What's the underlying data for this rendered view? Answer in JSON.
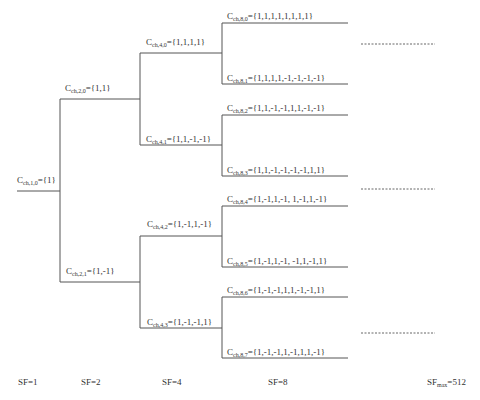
{
  "diagram": {
    "type": "OVSF code tree",
    "root": {
      "name": "C",
      "sub": "ch,1,0",
      "value": "={1}"
    },
    "level2": [
      {
        "name": "C",
        "sub": "ch,2,0",
        "value": "={1,1}"
      },
      {
        "name": "C",
        "sub": "ch,2,1",
        "value": "={1,-1}"
      }
    ],
    "level4": [
      {
        "name": "C",
        "sub": "ch,4,0",
        "value": "={1,1,1,1}"
      },
      {
        "name": "C",
        "sub": "ch,4,1",
        "value": "={1,1,-1,-1}"
      },
      {
        "name": "C",
        "sub": "ch,4,2",
        "value": "={1,-1,1,-1}"
      },
      {
        "name": "C",
        "sub": "ch,4,3",
        "value": "={1,-1,-1,1}"
      }
    ],
    "level8": [
      {
        "name": "C",
        "sub": "ch,8,0",
        "value": "={1,1,1,1,1,1,1,1}"
      },
      {
        "name": "C",
        "sub": "ch,8,1",
        "value": "={1,1,1,1,-1,-1,-1,-1}"
      },
      {
        "name": "C",
        "sub": "ch,8,2",
        "value": "={1,1,-1,-1,1,1,-1,-1}"
      },
      {
        "name": "C",
        "sub": "ch,8,3",
        "value": "={1,1,-1,-1,-1,-1,1,1}"
      },
      {
        "name": "C",
        "sub": "ch,8,4",
        "value": "={1,-1,1,-1, 1,-1,1,-1}"
      },
      {
        "name": "C",
        "sub": "ch,8,5",
        "value": "={1,-1,1,-1, -1,1,-1,1}"
      },
      {
        "name": "C",
        "sub": "ch,8,6",
        "value": "={1,-1,-1,1,1,-1,-1,1}"
      },
      {
        "name": "C",
        "sub": "ch,8,7",
        "value": "={1,-1,-1,1,-1,1,1,-1}"
      }
    ],
    "spreading_factors": [
      {
        "label": "SF=1"
      },
      {
        "label": "SF=2"
      },
      {
        "label": "SF=4"
      },
      {
        "label": "SF=8"
      },
      {
        "prefix": "SF",
        "sub": "max",
        "suffix": "=512"
      }
    ],
    "colors": {
      "line": "#555555",
      "text": "#333333",
      "background": "#ffffff"
    }
  }
}
